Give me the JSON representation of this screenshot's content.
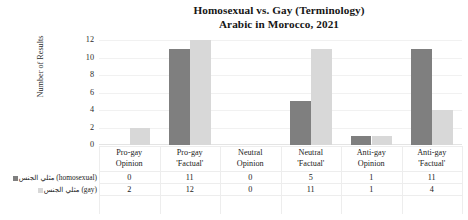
{
  "chart_data": {
    "type": "bar",
    "title": "Homosexual vs. Gay (Terminology)",
    "subtitle": "Arabic in Morocco, 2021",
    "xlabel": "",
    "ylabel": "Number of Results",
    "ylim": [
      0,
      12
    ],
    "yticks": [
      12,
      10,
      8,
      6,
      4,
      2,
      0
    ],
    "grid": true,
    "legend_position": "left-table",
    "categories": [
      {
        "line1": "Pro-gay",
        "line2": "Opinion"
      },
      {
        "line1": "Pro-gay",
        "line2": "'Factual'"
      },
      {
        "line1": "Neutral",
        "line2": "Opinion"
      },
      {
        "line1": "Neutral",
        "line2": "'Factual'"
      },
      {
        "line1": "Anti-gay",
        "line2": "Opinion"
      },
      {
        "line1": "Anti-gay",
        "line2": "'Factual'"
      }
    ],
    "series": [
      {
        "name": "مثلي الجنس (homosexual)",
        "name_arabic": "مثلي الجنس",
        "name_english": "(homosexual)",
        "color": "#7f7f7f",
        "values": [
          0,
          11,
          0,
          5,
          1,
          11
        ]
      },
      {
        "name": "مثلي الجنس (gay)",
        "name_arabic": "مثلي الجنس",
        "name_english": "(gay)",
        "color": "#d8d8d8",
        "values": [
          2,
          12,
          0,
          11,
          1,
          4
        ]
      }
    ]
  }
}
